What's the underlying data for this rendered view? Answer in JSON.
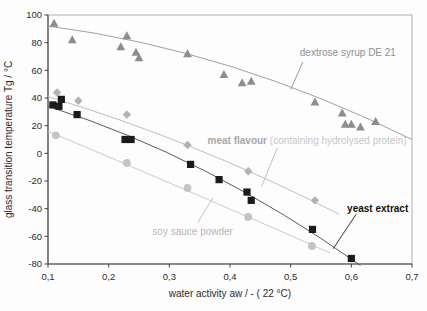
{
  "chart_data": {
    "type": "scatter",
    "title": "",
    "xlabel": "water activity aw / - ( 22 °C)",
    "ylabel": "glass transition temperature Tg / °C",
    "xlim": [
      0.1,
      0.7
    ],
    "ylim": [
      -80,
      100
    ],
    "grid": false,
    "legend_position": "inline-annotations",
    "axis_color": "#3f3f3f",
    "border_color": "#9c9c9c",
    "tick_text_color": "#2b2b2b",
    "x_ticks": [
      {
        "label": "0,1",
        "value": 0.1
      },
      {
        "label": "0,2",
        "value": 0.2
      },
      {
        "label": "0,3",
        "value": 0.3
      },
      {
        "label": "0,4",
        "value": 0.4
      },
      {
        "label": "0,5",
        "value": 0.5
      },
      {
        "label": "0,6",
        "value": 0.6
      },
      {
        "label": "0,7",
        "value": 0.7
      }
    ],
    "y_ticks": [
      {
        "label": "100",
        "value": 100
      },
      {
        "label": "80",
        "value": 80
      },
      {
        "label": "60",
        "value": 60
      },
      {
        "label": "40",
        "value": 40
      },
      {
        "label": "20",
        "value": 20
      },
      {
        "label": "0",
        "value": 0
      },
      {
        "label": "-20",
        "value": -20
      },
      {
        "label": "-40",
        "value": -40
      },
      {
        "label": "-60",
        "value": -60
      },
      {
        "label": "-80",
        "value": -80
      }
    ],
    "series": [
      {
        "name": "dextrose syrup DE 21",
        "marker": "triangle",
        "marker_color": "#8d8d8d",
        "line_color": "#a0a0a0",
        "points": [
          [
            0.11,
            94
          ],
          [
            0.14,
            82
          ],
          [
            0.22,
            77
          ],
          [
            0.23,
            85
          ],
          [
            0.245,
            73
          ],
          [
            0.25,
            69
          ],
          [
            0.33,
            72
          ],
          [
            0.39,
            57
          ],
          [
            0.42,
            51
          ],
          [
            0.435,
            52
          ],
          [
            0.54,
            37
          ],
          [
            0.585,
            29
          ],
          [
            0.59,
            21
          ],
          [
            0.6,
            21
          ],
          [
            0.615,
            19
          ],
          [
            0.64,
            23
          ]
        ],
        "trend": [
          [
            0.1,
            92
          ],
          [
            0.4,
            63
          ],
          [
            0.7,
            10
          ]
        ],
        "label": {
          "text": "dextrose syrup DE 21",
          "text2": "",
          "bold": false,
          "color": "#8f8f8f",
          "color2": "#8f8f8f",
          "pos": [
            0.515,
            73
          ],
          "anchor": "start"
        },
        "leader": [
          [
            0.52,
            66
          ],
          [
            0.5,
            46
          ]
        ],
        "leader_color": "#9a9a9a"
      },
      {
        "name": "meat flavour (containing hydrolysed protein)",
        "marker": "diamond",
        "marker_color": "#b2b2b2",
        "line_color": "#bfbfbf",
        "points": [
          [
            0.115,
            44
          ],
          [
            0.15,
            38
          ],
          [
            0.23,
            28
          ],
          [
            0.33,
            6
          ],
          [
            0.43,
            -13
          ],
          [
            0.54,
            -34
          ]
        ],
        "trend": [
          [
            0.1,
            41
          ],
          [
            0.34,
            4
          ],
          [
            0.58,
            -44
          ]
        ],
        "label": {
          "text": "meat flavour ",
          "text2": "(containing hydrolysed protein)",
          "bold": true,
          "color": "#a8a8a8",
          "color2": "#c7c7c7",
          "pos": [
            0.363,
            9
          ],
          "anchor": "start"
        },
        "leader": [
          [
            0.478,
            4
          ],
          [
            0.452,
            -24
          ]
        ],
        "leader_color": "#c2c2c2"
      },
      {
        "name": "yeast extract",
        "marker": "square",
        "marker_color": "#1b1b1b",
        "line_color": "#5b5b5b",
        "points": [
          [
            0.108,
            35
          ],
          [
            0.118,
            34
          ],
          [
            0.122,
            39
          ],
          [
            0.148,
            28
          ],
          [
            0.227,
            10
          ],
          [
            0.237,
            10
          ],
          [
            0.335,
            -8
          ],
          [
            0.382,
            -19
          ],
          [
            0.428,
            -28
          ],
          [
            0.435,
            -34
          ],
          [
            0.536,
            -55
          ],
          [
            0.6,
            -76
          ]
        ],
        "trend": [
          [
            0.1,
            34
          ],
          [
            0.36,
            -13
          ],
          [
            0.615,
            -81
          ]
        ],
        "label": {
          "text": "yeast extract",
          "text2": "",
          "bold": true,
          "color": "#111111",
          "color2": "#111111",
          "pos": [
            0.593,
            -40
          ],
          "anchor": "start"
        },
        "leader": [
          [
            0.608,
            -44
          ],
          [
            0.57,
            -69
          ]
        ],
        "leader_color": "#3a3a3a"
      },
      {
        "name": "soy sauce powder",
        "marker": "circle",
        "marker_color": "#c4c4c4",
        "line_color": "#cacaca",
        "points": [
          [
            0.113,
            13
          ],
          [
            0.23,
            -7
          ],
          [
            0.33,
            -25
          ],
          [
            0.43,
            -46
          ],
          [
            0.535,
            -67
          ]
        ],
        "trend": [
          [
            0.1,
            16
          ],
          [
            0.33,
            -27
          ],
          [
            0.565,
            -72
          ]
        ],
        "label": {
          "text": "soy sauce powder",
          "text2": "",
          "bold": false,
          "color": "#b7b7b7",
          "color2": "#b7b7b7",
          "pos": [
            0.272,
            -57
          ],
          "anchor": "start"
        },
        "leader": [
          [
            0.347,
            -50
          ],
          [
            0.372,
            -32
          ]
        ],
        "leader_color": "#c4c4c4"
      }
    ],
    "plot_box": {
      "left": 48,
      "top": 15,
      "right": 412,
      "bottom": 264
    },
    "canvas": {
      "width": 427,
      "height": 311
    },
    "fonts": {
      "tick_size": 9.5,
      "axis_label_size": 10,
      "series_label_size": 10
    }
  }
}
